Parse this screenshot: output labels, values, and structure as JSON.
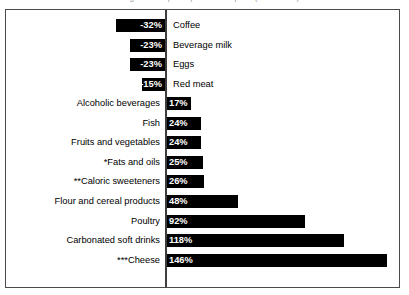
{
  "chart": {
    "title": "Change in U.S. per capita consumption (1970-2005)",
    "axis_label": "zero-axis"
  },
  "chart_data": {
    "type": "bar",
    "orientation": "horizontal",
    "title": "Change in U.S. per capita consumption (1970-2005)",
    "xlabel": "",
    "ylabel": "",
    "grid": false,
    "legend": false,
    "value_suffix": "%",
    "xlim": [
      -32,
      146
    ],
    "categories": [
      "Coffee",
      "Beverage milk",
      "Eggs",
      "Red meat",
      "Alcoholic beverages",
      "Fish",
      "Fruits and vegetables",
      "*Fats and oils",
      "**Caloric sweeteners",
      "Flour and cereal products",
      "Poultry",
      "Carbonated soft drinks",
      "***Cheese"
    ],
    "values": [
      -32,
      -23,
      -23,
      -15,
      17,
      24,
      24,
      25,
      26,
      48,
      92,
      118,
      146
    ],
    "value_labels": [
      "-32%",
      "-23%",
      "-23%",
      "-15%",
      "17%",
      "24%",
      "24%",
      "25%",
      "26%",
      "48%",
      "92%",
      "118%",
      "146%"
    ],
    "bar_color": "#000000",
    "value_text_color": "#ffffff"
  }
}
